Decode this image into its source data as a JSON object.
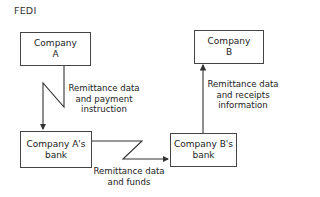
{
  "title": "FEDI",
  "nodes": {
    "company_a": {
      "line1": "Company",
      "line2": "A"
    },
    "company_b": {
      "line1": "Company",
      "line2": "B"
    },
    "bank_a": {
      "line1": "Company A's",
      "line2": "bank"
    },
    "bank_b": {
      "line1": "Company B's",
      "line2": "bank"
    }
  },
  "edges": {
    "a_to_bank_a": {
      "line1": "Remittance data",
      "line2": "and payment",
      "line3": "instruction"
    },
    "bank_a_to_bank_b": {
      "line1": "Remittance data",
      "line2": "and funds"
    },
    "bank_b_to_b": {
      "line1": "Remittance data",
      "line2": "and receipts",
      "line3": "information"
    }
  },
  "colors": {
    "line": "#333333",
    "text": "#222222",
    "background": "#ffffff"
  }
}
